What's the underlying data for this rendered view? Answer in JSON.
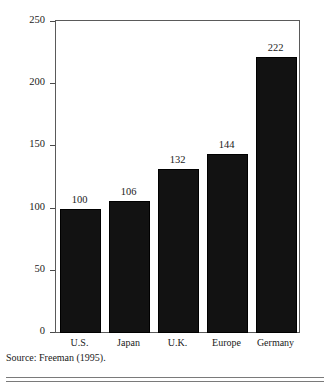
{
  "chart_data": {
    "type": "bar",
    "title": "",
    "subtitle": "",
    "xlabel": "",
    "ylabel": "Percent of U.S. wage",
    "categories": [
      "U.S.",
      "Japan",
      "U.K.",
      "Europe",
      "Germany"
    ],
    "values": [
      100,
      106,
      132,
      144,
      222
    ],
    "value_labels": [
      "100",
      "106",
      "132",
      "144",
      "222"
    ],
    "ylim": [
      0,
      250
    ],
    "yticks": [
      0,
      50,
      100,
      150,
      200,
      250
    ],
    "ytick_labels": [
      "0",
      "50",
      "100",
      "150",
      "200",
      "250"
    ],
    "grid": false,
    "legend": null,
    "bar_color": "#121212",
    "frame_color": "#5a5a5a",
    "background": "#ffffff",
    "annotations": []
  },
  "source": {
    "text": "Source: Freeman (1995)."
  }
}
